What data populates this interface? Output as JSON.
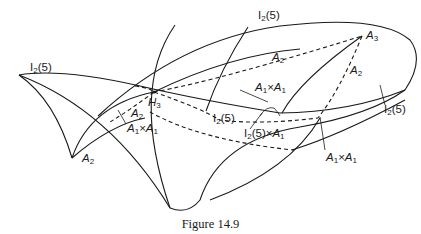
{
  "figure": {
    "caption": "Figure 14.9",
    "labels": {
      "i2_5_left": {
        "base": "I",
        "sub": "2",
        "rest": "(5)"
      },
      "i2_5_top": {
        "base": "I",
        "sub": "2",
        "rest": "(5)"
      },
      "i2_5_center": {
        "base": "I",
        "sub": "2",
        "rest": "(5)"
      },
      "i2_5_right": {
        "base": "I",
        "sub": "2",
        "rest": "(5)"
      },
      "a3": {
        "base": "A",
        "sub": "3"
      },
      "h3": {
        "base": "H",
        "sub": "3"
      },
      "a2_top": {
        "base": "A",
        "sub": "2"
      },
      "a2_right": {
        "base": "A",
        "sub": "2"
      },
      "a2_center": {
        "base": "A",
        "sub": "2"
      },
      "a2_bottom": {
        "base": "A",
        "sub": "2"
      },
      "a1xa1_left": {
        "a": "A",
        "sub1": "1",
        "x": "×",
        "b": "A",
        "sub2": "1"
      },
      "a1xa1_center": {
        "a": "A",
        "sub1": "1",
        "x": "×",
        "b": "A",
        "sub2": "1"
      },
      "a1xa1_right": {
        "a": "A",
        "sub1": "1",
        "x": "×",
        "b": "A",
        "sub2": "1"
      },
      "i2_5xa1": {
        "base": "I",
        "sub": "2",
        "rest": "(5)×",
        "b": "A",
        "sub2": "1"
      }
    }
  }
}
